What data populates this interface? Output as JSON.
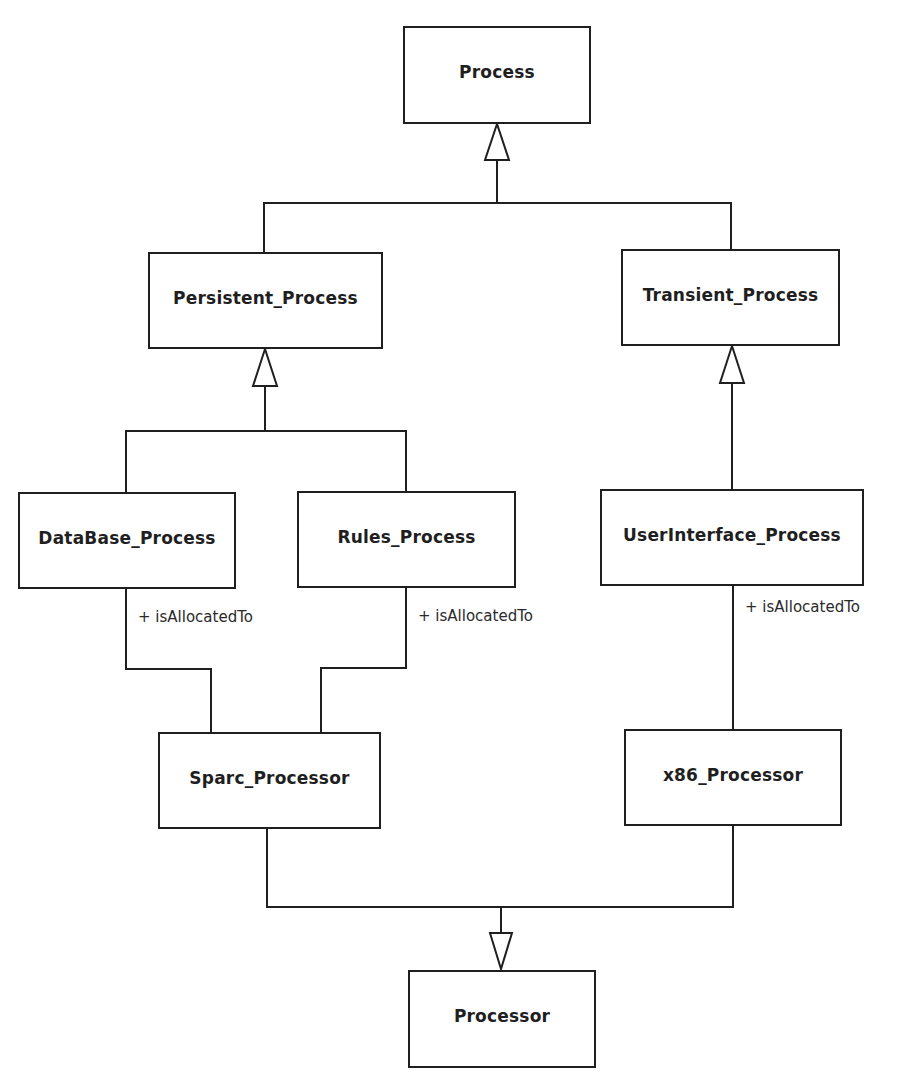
{
  "diagram": {
    "type": "UML class diagram",
    "classes": [
      {
        "id": "process",
        "name": "Process"
      },
      {
        "id": "persistent",
        "name": "Persistent_Process"
      },
      {
        "id": "transient",
        "name": "Transient_Process"
      },
      {
        "id": "database",
        "name": "DataBase_Process"
      },
      {
        "id": "rules",
        "name": "Rules_Process"
      },
      {
        "id": "userinterface",
        "name": "UserInterface_Process"
      },
      {
        "id": "sparc",
        "name": "Sparc_Processor"
      },
      {
        "id": "x86",
        "name": "x86_Processor"
      },
      {
        "id": "processor",
        "name": "Processor"
      }
    ],
    "generalizations": [
      {
        "child": "Persistent_Process",
        "parent": "Process"
      },
      {
        "child": "Transient_Process",
        "parent": "Process"
      },
      {
        "child": "DataBase_Process",
        "parent": "Persistent_Process"
      },
      {
        "child": "Rules_Process",
        "parent": "Persistent_Process"
      },
      {
        "child": "UserInterface_Process",
        "parent": "Transient_Process"
      },
      {
        "child": "Sparc_Processor",
        "parent": "Processor"
      },
      {
        "child": "x86_Processor",
        "parent": "Processor"
      }
    ],
    "associations": [
      {
        "from": "DataBase_Process",
        "to": "Sparc_Processor",
        "role": "+ isAllocatedTo"
      },
      {
        "from": "Rules_Process",
        "to": "Sparc_Processor",
        "role": "+ isAllocatedTo"
      },
      {
        "from": "UserInterface_Process",
        "to": "x86_Processor",
        "role": "+ isAllocatedTo"
      }
    ]
  },
  "labels": {
    "database_role": "+ isAllocatedTo",
    "rules_role": "+ isAllocatedTo",
    "ui_role": "+ isAllocatedTo"
  },
  "colors": {
    "line": "#1f1f1f",
    "background": "#ffffff"
  }
}
